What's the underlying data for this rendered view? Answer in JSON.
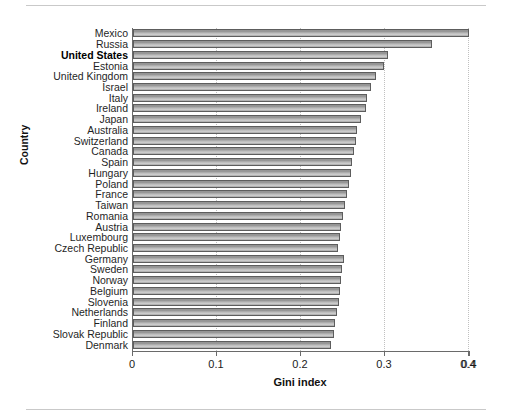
{
  "figure": {
    "ylabel": "Country",
    "xlabel": "Gini index"
  },
  "axis": {
    "tick_labels": [
      "0",
      "0.1",
      "0.2",
      "0.3",
      "0.4",
      "0.4"
    ],
    "tick_values": [
      0,
      0.1,
      0.2,
      0.3,
      0.4,
      0.4
    ]
  },
  "chart_data": {
    "type": "bar",
    "orientation": "horizontal",
    "title": "",
    "xlabel": "Gini index",
    "ylabel": "Country",
    "xlim": [
      0,
      0.4
    ],
    "grid": true,
    "legend": null,
    "highlighted_category": "United States",
    "categories": [
      "Mexico",
      "Russia",
      "United States",
      "Estonia",
      "United Kingdom",
      "Israel",
      "Italy",
      "Ireland",
      "Japan",
      "Australia",
      "Switzerland",
      "Canada",
      "Spain",
      "Hungary",
      "Poland",
      "France",
      "Taiwan",
      "Romania",
      "Austria",
      "Luxembourg",
      "Czech Republic",
      "Germany",
      "Sweden",
      "Norway",
      "Belgium",
      "Slovenia",
      "Netherlands",
      "Finland",
      "Slovak Republic",
      "Denmark"
    ],
    "values": [
      0.4,
      0.356,
      0.304,
      0.299,
      0.289,
      0.283,
      0.279,
      0.277,
      0.272,
      0.267,
      0.265,
      0.263,
      0.261,
      0.259,
      0.257,
      0.255,
      0.252,
      0.25,
      0.248,
      0.246,
      0.244,
      0.251,
      0.249,
      0.248,
      0.247,
      0.245,
      0.243,
      0.241,
      0.239,
      0.236
    ]
  }
}
